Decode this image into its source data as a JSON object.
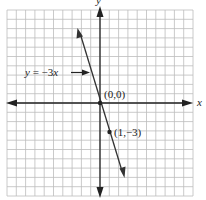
{
  "chart_data": {
    "type": "line",
    "title": "",
    "xlabel": "x",
    "ylabel": "y",
    "xlim": [
      -10,
      10
    ],
    "ylim": [
      -10,
      10
    ],
    "grid": true,
    "series": [
      {
        "name": "y = -3x",
        "equation": "y = -3x",
        "slope": -3,
        "intercept": 0,
        "x": [
          -2.4,
          2.6
        ],
        "y": [
          7.2,
          -7.8
        ]
      }
    ],
    "points": [
      {
        "label": "(0,0)",
        "x": 0,
        "y": 0
      },
      {
        "label": "(1,−3)",
        "x": 1,
        "y": -3
      }
    ],
    "annotations": [
      {
        "text": "y = −3x",
        "arrow_to": "line",
        "x": -5.2,
        "y": 4
      }
    ]
  },
  "labels": {
    "x_axis": "x",
    "y_axis": "y",
    "equation": "y = −3x",
    "origin": "(0,0)",
    "point": "(1,−3)"
  },
  "colors": {
    "grid": "#bdbdbd",
    "axis": "#222222",
    "line": "#333333"
  }
}
